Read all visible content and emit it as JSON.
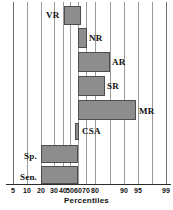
{
  "chart_data": {
    "type": "bar",
    "orientation": "horizontal",
    "subtype": "floating-range-bar",
    "title": "",
    "xlabel": "Percentiles",
    "ylabel": "",
    "scale": "probability",
    "grid": true,
    "legend": false,
    "xlim": [
      5,
      99
    ],
    "tick_labels": [
      "5",
      "10",
      "20",
      "30",
      "40",
      "50",
      "60",
      "70",
      "80",
      "90",
      "95",
      "99"
    ],
    "tick_values": [
      5,
      10,
      20,
      30,
      40,
      50,
      60,
      70,
      80,
      90,
      95,
      99
    ],
    "categories": [
      "VR",
      "NR",
      "AR",
      "SR",
      "MR",
      "CSA",
      "Sp.",
      "Sen."
    ],
    "bars": [
      {
        "label": "VR",
        "start": 47,
        "end": 57,
        "label_side": "left"
      },
      {
        "label": "NR",
        "start": 55,
        "end": 60,
        "label_side": "right"
      },
      {
        "label": "AR",
        "start": 55,
        "end": 81,
        "label_side": "right"
      },
      {
        "label": "SR",
        "start": 55,
        "end": 75,
        "label_side": "right"
      },
      {
        "label": "MR",
        "start": 55,
        "end": 93,
        "label_side": "right"
      },
      {
        "label": "CSA",
        "start": 53,
        "end": 55,
        "label_side": "right"
      },
      {
        "label": "Sp.",
        "start": 20,
        "end": 55,
        "label_side": "left"
      },
      {
        "label": "Sen.",
        "start": 20,
        "end": 55,
        "label_side": "left"
      }
    ]
  },
  "geometry": {
    "gridlines_px": [
      13,
      27,
      41,
      54,
      63,
      70,
      78,
      86,
      95,
      110,
      124,
      138,
      152,
      166
    ],
    "tick_px": [
      13,
      27,
      41,
      54,
      63,
      70,
      78,
      86,
      95,
      124,
      138,
      166
    ],
    "bars_px": [
      {
        "label": "VR",
        "x": 64,
        "w": 17,
        "y": 4,
        "h": 19,
        "label_x": 46,
        "label_y": 8
      },
      {
        "label": "NR",
        "x": 78,
        "w": 9,
        "y": 26,
        "h": 20,
        "label_x": 89,
        "label_y": 31
      },
      {
        "label": "AR",
        "x": 78,
        "w": 32,
        "y": 50,
        "h": 20,
        "label_x": 112,
        "label_y": 55
      },
      {
        "label": "SR",
        "x": 78,
        "w": 27,
        "y": 74,
        "h": 20,
        "label_x": 107,
        "label_y": 79
      },
      {
        "label": "MR",
        "x": 78,
        "w": 58,
        "y": 98,
        "h": 20,
        "label_x": 139,
        "label_y": 104
      },
      {
        "label": "CSA",
        "x": 75,
        "w": 4,
        "y": 121,
        "h": 17,
        "label_x": 82,
        "label_y": 124
      },
      {
        "label": "Sp.",
        "x": 41,
        "w": 37,
        "y": 143,
        "h": 18,
        "label_x": 24,
        "label_y": 149
      },
      {
        "label": "Sen.",
        "x": 41,
        "w": 37,
        "y": 164,
        "h": 18,
        "label_x": 20,
        "label_y": 170
      }
    ]
  },
  "colors": {
    "bar_fill": "#8d8d8d",
    "bar_border": "#4d4d4d",
    "gridline": "#9a9a9a",
    "axis": "#2b2b2b",
    "text": "#111111",
    "background": "#ffffff"
  }
}
